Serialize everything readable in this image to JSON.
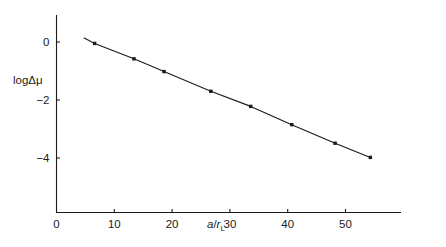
{
  "chart_data": {
    "type": "line",
    "title": "",
    "xlabel": "a/r_L",
    "ylabel": "logΔμ",
    "xlabel_parts": {
      "numerator": "a",
      "slash": "/",
      "denominator": "r",
      "subscript": "L"
    },
    "ylabel_parts": {
      "log": "log",
      "delta": "Δ",
      "mu": "μ"
    },
    "xlim": [
      0,
      61
    ],
    "ylim": [
      -5.9,
      0.45
    ],
    "xticks": [
      0,
      10,
      20,
      30,
      40,
      50
    ],
    "xtick_labels": [
      "0",
      "10",
      "20",
      "30",
      "40",
      "50"
    ],
    "yticks": [
      0,
      -2,
      -4
    ],
    "ytick_labels": [
      "0",
      "−2",
      "−4"
    ],
    "grid": false,
    "legend": null,
    "line_color": "#1a1a1a",
    "marker_color": "#1a1a1a",
    "marker": "square",
    "x": [
      6.6,
      13.4,
      18.6,
      26.7,
      33.6,
      40.7,
      48.2,
      54.3
    ],
    "y": [
      -0.05,
      -0.58,
      -1.02,
      -1.7,
      -2.22,
      -2.85,
      -3.49,
      -3.98
    ],
    "curve_x": [
      4.8,
      6.6,
      13.4,
      18.6,
      26.7,
      33.6,
      40.7,
      48.2,
      54.3
    ],
    "curve_y": [
      0.14,
      -0.05,
      -0.58,
      -1.02,
      -1.7,
      -2.22,
      -2.85,
      -3.49,
      -3.98
    ],
    "series": [
      {
        "name": "logΔμ vs a/r_L",
        "points": [
          {
            "x": 6.6,
            "y": -0.05
          },
          {
            "x": 13.4,
            "y": -0.58
          },
          {
            "x": 18.6,
            "y": -1.02
          },
          {
            "x": 26.7,
            "y": -1.7
          },
          {
            "x": 33.6,
            "y": -2.22
          },
          {
            "x": 40.7,
            "y": -2.85
          },
          {
            "x": 48.2,
            "y": -3.49
          },
          {
            "x": 54.3,
            "y": -3.98
          }
        ]
      }
    ]
  },
  "axes": {
    "x_axis_name": "horizontal-axis",
    "y_axis_name": "vertical-axis"
  }
}
